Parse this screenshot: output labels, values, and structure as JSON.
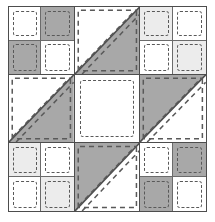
{
  "figure": {
    "width": 215,
    "height": 222,
    "background_color": "#ffffff",
    "outline_color": "#4d4d4d",
    "seam_line_color": "#6b6b6b",
    "stitch_line_color": "#595959",
    "stitch_style": "dashed"
  },
  "palette": {
    "white": "#ffffff",
    "light_gray": "#ececec",
    "medium_gray": "#a8a8a8",
    "seam": "#6b6b6b",
    "outline": "#4d4d4d"
  },
  "layout": {
    "grid_rows": 3,
    "grid_columns": 3,
    "cell_count": 9
  },
  "cells": [
    {
      "position": "top-left",
      "row": 1,
      "column": 1,
      "type": "four-patch",
      "patches": [
        {
          "position": "top-left",
          "fill": "white",
          "color": "#ffffff"
        },
        {
          "position": "top-right",
          "fill": "gray",
          "color": "#a8a8a8"
        },
        {
          "position": "bottom-left",
          "fill": "gray",
          "color": "#a8a8a8"
        },
        {
          "position": "bottom-right",
          "fill": "white",
          "color": "#ffffff"
        }
      ]
    },
    {
      "position": "top-center",
      "row": 1,
      "column": 2,
      "type": "half-square-triangle",
      "orientation": "upper-left-white",
      "diagonal": "anti-diagonal",
      "triangles": [
        {
          "position": "upper-left",
          "fill": "white",
          "color": "#ffffff"
        },
        {
          "position": "lower-right",
          "fill": "gray",
          "color": "#a8a8a8"
        }
      ]
    },
    {
      "position": "top-right",
      "row": 1,
      "column": 3,
      "type": "four-patch",
      "patches": [
        {
          "position": "top-left",
          "fill": "light",
          "color": "#ececec"
        },
        {
          "position": "top-right",
          "fill": "white",
          "color": "#ffffff"
        },
        {
          "position": "bottom-left",
          "fill": "white",
          "color": "#ffffff"
        },
        {
          "position": "bottom-right",
          "fill": "light",
          "color": "#ececec"
        }
      ]
    },
    {
      "position": "middle-left",
      "row": 2,
      "column": 1,
      "type": "half-square-triangle",
      "orientation": "upper-left-white",
      "diagonal": "anti-diagonal",
      "triangles": [
        {
          "position": "upper-left",
          "fill": "white",
          "color": "#ffffff"
        },
        {
          "position": "lower-right",
          "fill": "gray",
          "color": "#a8a8a8"
        }
      ]
    },
    {
      "position": "center",
      "row": 2,
      "column": 2,
      "type": "plain-square",
      "fill": "white",
      "color": "#ffffff"
    },
    {
      "position": "middle-right",
      "row": 2,
      "column": 3,
      "type": "half-square-triangle",
      "orientation": "upper-left-gray",
      "diagonal": "anti-diagonal",
      "triangles": [
        {
          "position": "upper-left",
          "fill": "gray",
          "color": "#a8a8a8"
        },
        {
          "position": "lower-right",
          "fill": "white",
          "color": "#ffffff"
        }
      ]
    },
    {
      "position": "bottom-left",
      "row": 3,
      "column": 1,
      "type": "four-patch",
      "patches": [
        {
          "position": "top-left",
          "fill": "light",
          "color": "#ececec"
        },
        {
          "position": "top-right",
          "fill": "white",
          "color": "#ffffff"
        },
        {
          "position": "bottom-left",
          "fill": "white",
          "color": "#ffffff"
        },
        {
          "position": "bottom-right",
          "fill": "light",
          "color": "#ececec"
        }
      ]
    },
    {
      "position": "bottom-center",
      "row": 3,
      "column": 2,
      "type": "half-square-triangle",
      "orientation": "upper-left-gray",
      "diagonal": "anti-diagonal",
      "triangles": [
        {
          "position": "upper-left",
          "fill": "gray",
          "color": "#a8a8a8"
        },
        {
          "position": "lower-right",
          "fill": "white",
          "color": "#ffffff"
        }
      ]
    },
    {
      "position": "bottom-right",
      "row": 3,
      "column": 3,
      "type": "four-patch",
      "patches": [
        {
          "position": "top-left",
          "fill": "white",
          "color": "#ffffff"
        },
        {
          "position": "top-right",
          "fill": "gray",
          "color": "#a8a8a8"
        },
        {
          "position": "bottom-left",
          "fill": "gray",
          "color": "#a8a8a8"
        },
        {
          "position": "bottom-right",
          "fill": "white",
          "color": "#ffffff"
        }
      ]
    }
  ]
}
